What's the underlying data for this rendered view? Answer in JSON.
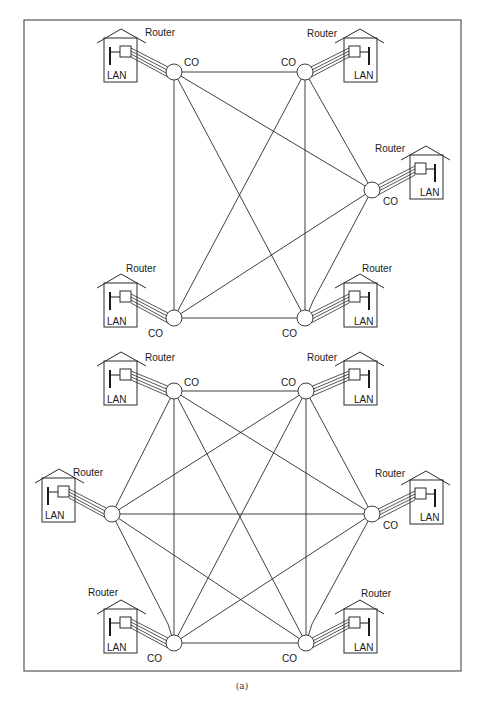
{
  "figure": {
    "caption": "(a)",
    "labels": {
      "router": "Router",
      "lan": "LAN",
      "co": "CO"
    },
    "colors": {
      "line": "#2a2a2a",
      "frame": "#555555",
      "background": "#ffffff"
    }
  },
  "panels": [
    {
      "id": "top",
      "topology": "full-mesh",
      "node_count": 5,
      "edge_count": 10,
      "nodes": [
        {
          "id": "TL",
          "co": [
            174,
            72
          ],
          "house": "left",
          "house_box": [
            104,
            38
          ],
          "router_label": "Router",
          "lan_label": "LAN",
          "co_label": "CO"
        },
        {
          "id": "TR",
          "co": [
            305,
            72
          ],
          "house": "right",
          "house_box": [
            344,
            38
          ],
          "router_label": "Router",
          "lan_label": "LAN",
          "co_label": "CO"
        },
        {
          "id": "R",
          "co": [
            372,
            190
          ],
          "house": "right",
          "house_box": [
            410,
            157
          ],
          "router_label": "Router",
          "lan_label": "LAN",
          "co_label": "CO"
        },
        {
          "id": "BL",
          "co": [
            174,
            318
          ],
          "house": "left",
          "house_box": [
            104,
            283
          ],
          "router_label": "Router",
          "lan_label": "LAN",
          "co_label": "CO"
        },
        {
          "id": "BR",
          "co": [
            305,
            318
          ],
          "house": "right",
          "house_box": [
            344,
            283
          ],
          "router_label": "Router",
          "lan_label": "LAN",
          "co_label": "CO"
        }
      ]
    },
    {
      "id": "bottom",
      "topology": "full-mesh",
      "node_count": 6,
      "edge_count": 15,
      "nodes": [
        {
          "id": "TL",
          "co": [
            174,
            391
          ],
          "house": "left",
          "house_box": [
            104,
            361
          ],
          "router_label": "Router",
          "lan_label": "LAN",
          "co_label": "CO"
        },
        {
          "id": "TR",
          "co": [
            306,
            391
          ],
          "house": "right",
          "house_box": [
            344,
            361
          ],
          "router_label": "Router",
          "lan_label": "LAN",
          "co_label": "CO"
        },
        {
          "id": "L",
          "co": [
            112,
            514
          ],
          "house": "left",
          "house_box": [
            42,
            478
          ],
          "router_label": "Router",
          "lan_label": "LAN",
          "co_label": ""
        },
        {
          "id": "R",
          "co": [
            372,
            514
          ],
          "house": "right",
          "house_box": [
            410,
            481
          ],
          "router_label": "Router",
          "lan_label": "LAN",
          "co_label": "CO"
        },
        {
          "id": "BL",
          "co": [
            174,
            643
          ],
          "house": "left",
          "house_box": [
            104,
            609
          ],
          "router_label": "Router",
          "lan_label": "LAN",
          "co_label": "CO"
        },
        {
          "id": "BR",
          "co": [
            306,
            643
          ],
          "house": "right",
          "house_box": [
            344,
            609
          ],
          "router_label": "Router",
          "lan_label": "LAN",
          "co_label": "CO"
        }
      ]
    }
  ]
}
